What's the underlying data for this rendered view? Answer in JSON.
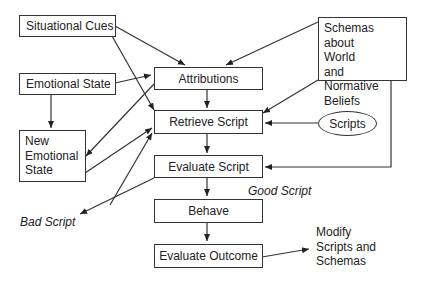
{
  "diagram": {
    "nodes": {
      "situational_cues": "Situational Cues",
      "emotional_state": "Emotional State",
      "new_emotional_state": [
        "New",
        "Emotional",
        "State"
      ],
      "attributions": "Attributions",
      "retrieve_script": "Retrieve Script",
      "evaluate_script": "Evaluate Script",
      "behave": "Behave",
      "evaluate_outcome": "Evaluate Outcome",
      "schemas": [
        "Schemas about",
        "World",
        "and Normative",
        "Beliefs"
      ],
      "scripts": "Scripts"
    },
    "labels": {
      "good_script": "Good Script",
      "bad_script": "Bad Script",
      "modify": [
        "Modify",
        "Scripts and",
        "Schemas"
      ]
    },
    "edges": [
      {
        "from": "Situational Cues",
        "to": "Attributions"
      },
      {
        "from": "Situational Cues",
        "to": "Retrieve Script"
      },
      {
        "from": "Emotional State",
        "to": "Attributions"
      },
      {
        "from": "Emotional State",
        "to": "New Emotional State"
      },
      {
        "from": "Attributions",
        "to": "New Emotional State"
      },
      {
        "from": "Attributions",
        "to": "Retrieve Script"
      },
      {
        "from": "New Emotional State",
        "to": "Retrieve Script"
      },
      {
        "from": "Schemas about World and Normative Beliefs",
        "to": "Attributions"
      },
      {
        "from": "Schemas about World and Normative Beliefs",
        "to": "Retrieve Script"
      },
      {
        "from": "Schemas about World and Normative Beliefs",
        "to": "Evaluate Script"
      },
      {
        "from": "Scripts",
        "to": "Retrieve Script"
      },
      {
        "from": "Retrieve Script",
        "to": "Evaluate Script"
      },
      {
        "from": "Evaluate Script",
        "to": "Behave",
        "label": "Good Script"
      },
      {
        "from": "Evaluate Script",
        "to": "Bad Script"
      },
      {
        "from": "Bad Script",
        "to": "Retrieve Script"
      },
      {
        "from": "Behave",
        "to": "Evaluate Outcome"
      },
      {
        "from": "Evaluate Outcome",
        "to": "Modify Scripts and Schemas"
      }
    ]
  }
}
